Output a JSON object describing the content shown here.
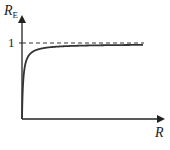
{
  "chart_data": {
    "type": "line",
    "title": "",
    "xlabel": "R",
    "ylabel": "R_E",
    "ylabel_main": "R",
    "ylabel_sub": "E",
    "y_ticks": [
      {
        "value": 1,
        "label": "1"
      }
    ],
    "x_ticks": [],
    "asymptote": {
      "y": 1,
      "style": "dashed"
    },
    "ylim": [
      0,
      1.25
    ],
    "grid": false,
    "legend": null,
    "series": [
      {
        "name": "R_E vs R",
        "description": "saturating curve rising from origin toward asymptote 1",
        "x": [
          0,
          0.05,
          0.1,
          0.2,
          0.3,
          0.5,
          0.75,
          1.0,
          1.5,
          2.0,
          3.0,
          4.0,
          5.0
        ],
        "values": [
          0,
          0.5,
          0.67,
          0.8,
          0.86,
          0.91,
          0.94,
          0.95,
          0.965,
          0.97,
          0.975,
          0.978,
          0.98
        ]
      }
    ]
  },
  "labels": {
    "y_axis_main": "R",
    "y_axis_sub": "E",
    "x_axis": "R",
    "y_tick_1": "1"
  }
}
